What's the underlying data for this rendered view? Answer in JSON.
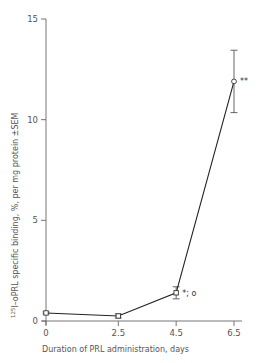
{
  "chart_data": {
    "type": "line",
    "title": "",
    "xlabel": "Duration of PRL administration, days",
    "ylabel": "125I–oPRL specific binding, %, per mg protein ±SEM",
    "ylabel_sup": "125",
    "ylabel_main": "I–oPRL specific binding, %, per mg protein ±SEM",
    "xlim": [
      0,
      6.5
    ],
    "ylim": [
      0,
      15
    ],
    "grid": false,
    "x_ticks": [
      0,
      2.5,
      4.5,
      6.5
    ],
    "x_tick_labels": [
      "0",
      "2.5",
      "4.5",
      "6.5"
    ],
    "y_ticks": [
      0,
      5,
      10,
      15
    ],
    "y_tick_labels": [
      "0",
      "5",
      "10",
      "15"
    ],
    "series": [
      {
        "name": "125I-oPRL specific binding",
        "x": [
          0,
          2.5,
          4.5,
          6.5
        ],
        "values": [
          0.4,
          0.25,
          1.4,
          11.9
        ],
        "sem": [
          0.05,
          0.1,
          0.3,
          1.55
        ],
        "markers": [
          "square",
          "square",
          "square",
          "circle"
        ]
      }
    ],
    "annotations": [
      {
        "x": 4.5,
        "y": 1.4,
        "text": "*; o"
      },
      {
        "x": 6.5,
        "y": 11.9,
        "text": "**"
      }
    ]
  }
}
